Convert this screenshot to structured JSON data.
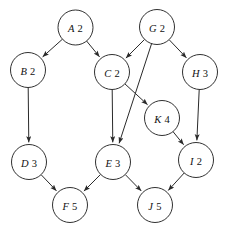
{
  "diagram": {
    "type": "directed-graph",
    "background_color": "#ffffff",
    "node_fill": "#ffffff",
    "node_stroke": "#1a1a1a",
    "edge_color": "#2a2a2a",
    "node_radius": 17.5,
    "nodes": [
      {
        "id": "A",
        "label": "A",
        "value": "2",
        "text": "A 2",
        "cx": 75.5,
        "cy": 27.5
      },
      {
        "id": "G",
        "label": "G",
        "value": "2",
        "text": "G 2",
        "cx": 157.0,
        "cy": 27.0
      },
      {
        "id": "B",
        "label": "B",
        "value": "2",
        "text": "B 2",
        "cx": 28.0,
        "cy": 70.0
      },
      {
        "id": "C",
        "label": "C",
        "value": "2",
        "text": "C 2",
        "cx": 112.0,
        "cy": 72.0
      },
      {
        "id": "H",
        "label": "H",
        "value": "3",
        "text": "H 3",
        "cx": 200.0,
        "cy": 72.0
      },
      {
        "id": "K",
        "label": "K",
        "value": "4",
        "text": "K 4",
        "cx": 162.0,
        "cy": 118.0
      },
      {
        "id": "D",
        "label": "D",
        "value": "3",
        "text": "D 3",
        "cx": 29.0,
        "cy": 162.0
      },
      {
        "id": "E",
        "label": "E",
        "value": "3",
        "text": "E 3",
        "cx": 113.0,
        "cy": 162.0
      },
      {
        "id": "I",
        "label": "I",
        "value": "2",
        "text": "I 2",
        "cx": 196.0,
        "cy": 160.0
      },
      {
        "id": "F",
        "label": "F",
        "value": "5",
        "text": "F 5",
        "cx": 70.0,
        "cy": 205.0
      },
      {
        "id": "J",
        "label": "J",
        "value": "5",
        "text": "J 5",
        "cx": 155.0,
        "cy": 205.0
      }
    ],
    "edges": [
      {
        "from": "A",
        "to": "B"
      },
      {
        "from": "A",
        "to": "C"
      },
      {
        "from": "G",
        "to": "C"
      },
      {
        "from": "G",
        "to": "E"
      },
      {
        "from": "G",
        "to": "H"
      },
      {
        "from": "B",
        "to": "D"
      },
      {
        "from": "C",
        "to": "E"
      },
      {
        "from": "C",
        "to": "K"
      },
      {
        "from": "H",
        "to": "I"
      },
      {
        "from": "K",
        "to": "I"
      },
      {
        "from": "D",
        "to": "F"
      },
      {
        "from": "E",
        "to": "F"
      },
      {
        "from": "E",
        "to": "J"
      },
      {
        "from": "I",
        "to": "J"
      }
    ]
  }
}
